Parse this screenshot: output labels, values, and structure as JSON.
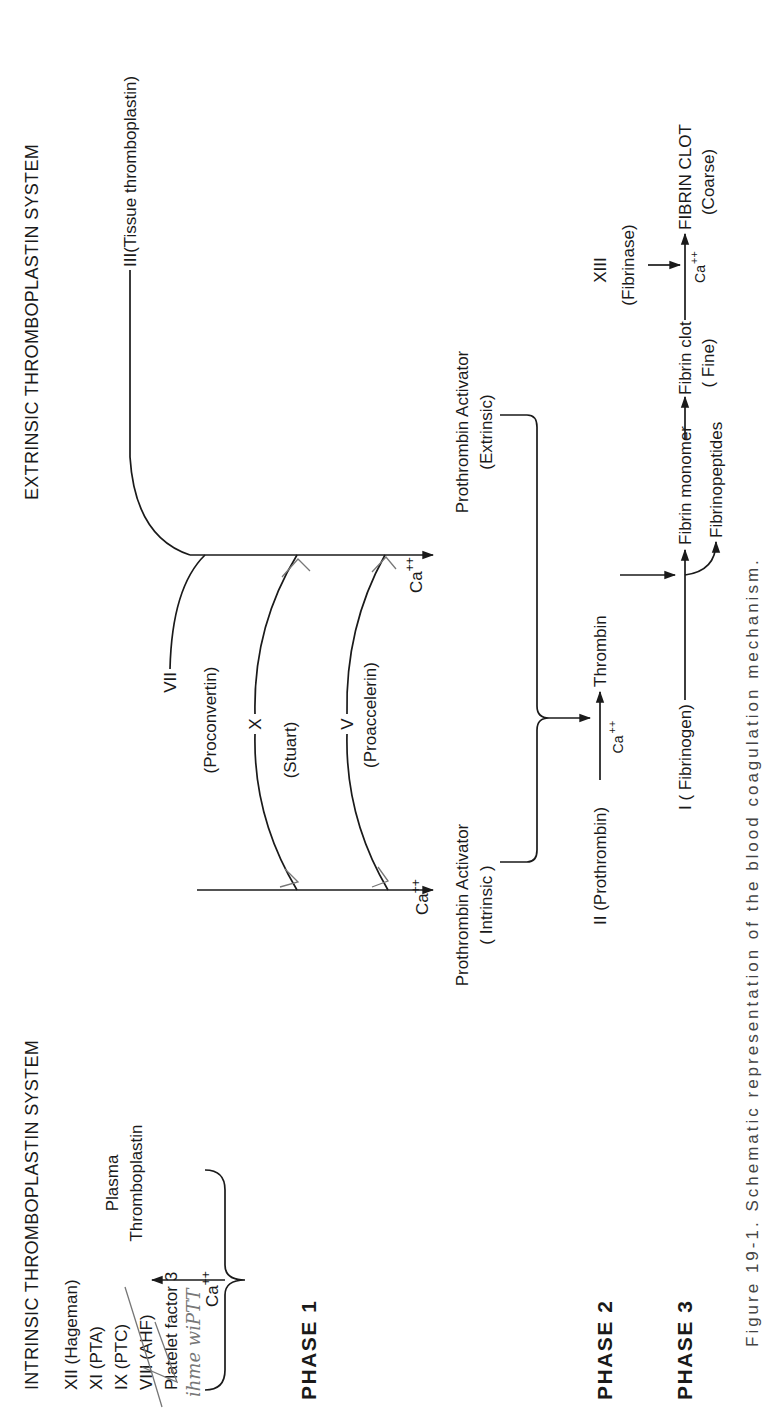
{
  "headers": {
    "intrinsic": "INTRINSIC THROMBOPLASTIN SYSTEM",
    "extrinsic": "EXTRINSIC THROMBOPLASTIN SYSTEM"
  },
  "phases": {
    "phase1": "PHASE 1",
    "phase2": "PHASE 2",
    "phase3": "PHASE 3"
  },
  "intrinsic_factors": [
    "XII (Hageman)",
    "XI (PTA)",
    "IX (PTC)",
    "VIII (AHF)",
    "Platelet factor 3"
  ],
  "calcium": "Ca",
  "calcium_sup": "++",
  "plasma_thromboplastin": {
    "line1": "Plasma",
    "line2": "Thromboplastin"
  },
  "tissue_thromboplastin": "III(Tissue thromboplastin)",
  "extrinsic_factors": {
    "vii": "VII",
    "vii_name": "(Proconvertin)",
    "x": "X",
    "x_name": "(Stuart)",
    "v": "V",
    "v_name": "(Proaccelerin)"
  },
  "activators": {
    "intrinsic_line1": "Prothrombin Activator",
    "intrinsic_line2": "( Intrinsic )",
    "extrinsic_line1": "Prothrombin Activator",
    "extrinsic_line2": "(Extrinsic)"
  },
  "phase2": {
    "substrate": "II (Prothrombin)",
    "product": "Thrombin"
  },
  "phase3": {
    "substrate": "I ( Fibrinogen)",
    "monomer": "Fibrin monomer",
    "byproduct": "Fibrinopeptides",
    "fine_clot": "Fibrin clot",
    "fine_label": "( Fine)",
    "stabilizer": "XIII",
    "stabilizer_name": "(Fibrinase)",
    "coarse_clot": "FIBRIN CLOT",
    "coarse_label": "(Coarse)"
  },
  "annotations": {
    "handwritten": "ihme  wiPTT"
  },
  "caption": "Figure 19-1.   Schematic representation of the blood coagulation mechanism."
}
